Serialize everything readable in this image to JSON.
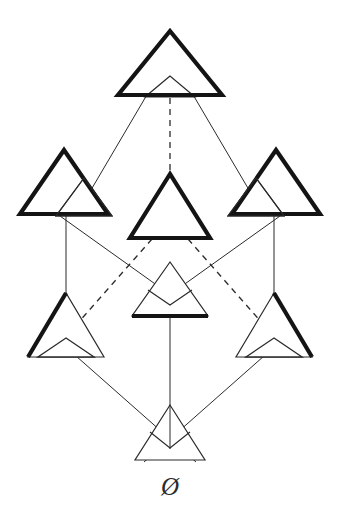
{
  "figure": {
    "type": "hasse-diagram",
    "title": "",
    "background_color": "#ffffff",
    "ink_color": "#2b2b2b",
    "bold_color": "#141414",
    "width": 338,
    "height": 523,
    "bottom_label": "Ø",
    "bottom_label_name": "empty-set-symbol"
  },
  "nodes": [
    {
      "id": "top",
      "name": "node-top",
      "rank": 0,
      "center": {
        "x": 170,
        "y": 64
      },
      "glyph": "triangle-pair-bold-outer-thin-inner",
      "bold_triangle": {
        "apex_x": 170,
        "apex_y": 31,
        "half_width": 52,
        "base_y": 95
      },
      "thin_triangle": {
        "apex_x": 170,
        "apex_y": 76,
        "half_width": 25,
        "base_y": 97
      },
      "label": ""
    },
    {
      "id": "upper-left",
      "name": "node-upper-left",
      "rank": 1,
      "center": {
        "x": 66,
        "y": 182
      },
      "glyph": "triangle-pair-bold-left-thin-right",
      "bold_triangle": {
        "apex_x": 64,
        "apex_y": 150,
        "half_width": 44,
        "base_y": 215
      },
      "thin_triangle": {
        "apex_x": 84,
        "apex_y": 178,
        "half_width": 28,
        "base_y": 216
      },
      "label": ""
    },
    {
      "id": "upper-center",
      "name": "node-upper-center",
      "rank": 1,
      "center": {
        "x": 170,
        "y": 205
      },
      "glyph": "triangle-bold-single",
      "bold_triangle": {
        "apex_x": 170,
        "apex_y": 174,
        "half_width": 40,
        "base_y": 240
      },
      "thin_triangle": null,
      "label": ""
    },
    {
      "id": "upper-right",
      "name": "node-upper-right",
      "rank": 1,
      "center": {
        "x": 274,
        "y": 182
      },
      "glyph": "triangle-pair-bold-right-thin-left",
      "bold_triangle": {
        "apex_x": 276,
        "apex_y": 150,
        "half_width": 44,
        "base_y": 215
      },
      "thin_triangle": {
        "apex_x": 256,
        "apex_y": 178,
        "half_width": 28,
        "base_y": 216
      },
      "label": ""
    },
    {
      "id": "lower-left",
      "name": "node-lower-left",
      "rank": 2,
      "center": {
        "x": 66,
        "y": 325
      },
      "glyph": "triangle-pair-boldleftedge-thin-right",
      "bold_triangle": {
        "apex_x": 66,
        "apex_y": 293,
        "half_width": 36,
        "base_y": 357
      },
      "thin_triangle": {
        "apex_x": 66,
        "apex_y": 338,
        "half_width": 36,
        "base_y": 357
      },
      "label": ""
    },
    {
      "id": "lower-center",
      "name": "node-lower-center",
      "rank": 2,
      "center": {
        "x": 170,
        "y": 292
      },
      "glyph": "triangle-thin-with-bold-base-and-inner-peak",
      "bold_triangle": {
        "apex_x": 170,
        "apex_y": 262,
        "half_width": 38,
        "base_y": 316
      },
      "thin_triangle": {
        "apex_x": 170,
        "apex_y": 262,
        "half_width": 38,
        "base_y": 316
      },
      "label": ""
    },
    {
      "id": "lower-right",
      "name": "node-lower-right",
      "rank": 2,
      "center": {
        "x": 274,
        "y": 325
      },
      "glyph": "triangle-pair-boldrightedge-thin-left",
      "bold_triangle": {
        "apex_x": 274,
        "apex_y": 293,
        "half_width": 36,
        "base_y": 357
      },
      "thin_triangle": {
        "apex_x": 274,
        "apex_y": 338,
        "half_width": 36,
        "base_y": 357
      },
      "label": ""
    },
    {
      "id": "bottom",
      "name": "node-bottom",
      "rank": 3,
      "center": {
        "x": 170,
        "y": 435
      },
      "glyph": "triangle-thin-with-inner-peak",
      "bold_triangle": null,
      "thin_triangle": {
        "apex_x": 170,
        "apex_y": 405,
        "half_width": 35,
        "base_y": 460
      },
      "label": "Ø"
    }
  ],
  "edges": [
    {
      "name": "edge-top-to-upper-left",
      "from": "top",
      "to": "upper-left",
      "style": "solid"
    },
    {
      "name": "edge-top-to-upper-center",
      "from": "top",
      "to": "upper-center",
      "style": "dashed"
    },
    {
      "name": "edge-top-to-upper-right",
      "from": "top",
      "to": "upper-right",
      "style": "solid"
    },
    {
      "name": "edge-upper-left-to-lower-left",
      "from": "upper-left",
      "to": "lower-left",
      "style": "solid"
    },
    {
      "name": "edge-upper-left-to-lower-center",
      "from": "upper-left",
      "to": "lower-center",
      "style": "solid"
    },
    {
      "name": "edge-upper-center-to-lower-left",
      "from": "upper-center",
      "to": "lower-left",
      "style": "dashed"
    },
    {
      "name": "edge-upper-center-to-lower-right",
      "from": "upper-center",
      "to": "lower-right",
      "style": "dashed"
    },
    {
      "name": "edge-upper-right-to-lower-right",
      "from": "upper-right",
      "to": "lower-right",
      "style": "solid"
    },
    {
      "name": "edge-upper-right-to-lower-center",
      "from": "upper-right",
      "to": "lower-center",
      "style": "solid"
    },
    {
      "name": "edge-lower-left-to-bottom",
      "from": "lower-left",
      "to": "bottom",
      "style": "solid"
    },
    {
      "name": "edge-lower-center-to-bottom",
      "from": "lower-center",
      "to": "bottom",
      "style": "solid"
    },
    {
      "name": "edge-lower-right-to-bottom",
      "from": "lower-right",
      "to": "bottom",
      "style": "solid"
    }
  ]
}
